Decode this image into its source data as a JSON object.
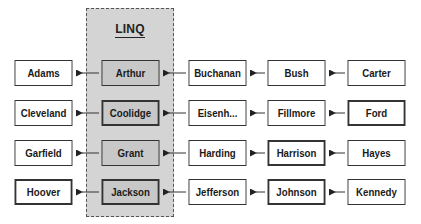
{
  "diagram": {
    "linq_label": "LINQ",
    "rows": [
      {
        "cells": [
          {
            "name": "Adams",
            "thick": false
          },
          {
            "name": "Arthur",
            "thick": false
          },
          {
            "name": "Buchanan",
            "thick": false
          },
          {
            "name": "Bush",
            "thick": false
          },
          {
            "name": "Carter",
            "thick": false
          }
        ]
      },
      {
        "cells": [
          {
            "name": "Cleveland",
            "thick": false
          },
          {
            "name": "Coolidge",
            "thick": true
          },
          {
            "name": "Eisenh...",
            "thick": false
          },
          {
            "name": "Fillmore",
            "thick": false
          },
          {
            "name": "Ford",
            "thick": true
          }
        ]
      },
      {
        "cells": [
          {
            "name": "Garfield",
            "thick": false
          },
          {
            "name": "Grant",
            "thick": false
          },
          {
            "name": "Harding",
            "thick": false
          },
          {
            "name": "Harrison",
            "thick": true
          },
          {
            "name": "Hayes",
            "thick": false
          }
        ]
      },
      {
        "cells": [
          {
            "name": "Hoover",
            "thick": true
          },
          {
            "name": "Jackson",
            "thick": true
          },
          {
            "name": "Jefferson",
            "thick": false
          },
          {
            "name": "Johnson",
            "thick": true
          },
          {
            "name": "Kennedy",
            "thick": false
          }
        ]
      }
    ],
    "arrow_direction": "right-to-left"
  },
  "colors": {
    "panel_fill": "#d4d4d4",
    "linq_box_fill": "#c8c8c8",
    "box_fill": "#ffffff",
    "line": "#333333"
  }
}
